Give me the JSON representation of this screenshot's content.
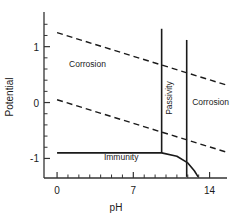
{
  "chart_data": {
    "type": "line",
    "title": "",
    "xlabel": "pH",
    "ylabel": "Potential",
    "xlim": [
      -1.2,
      15.6
    ],
    "ylim": [
      -1.35,
      1.62
    ],
    "grid": false,
    "legend": false,
    "xticks": [
      0,
      7,
      14
    ],
    "xtick_labels": [
      "0",
      "7",
      "14"
    ],
    "x_minor_ticks": [
      1,
      2,
      3,
      4,
      5,
      6,
      8,
      9,
      10,
      11,
      12,
      13
    ],
    "yticks": [
      1,
      0,
      -1
    ],
    "ytick_labels": [
      "1",
      "0",
      "-1"
    ],
    "y_minor_ticks": [
      -0.8,
      -0.6,
      -0.4,
      -0.2,
      0.2,
      0.4,
      0.6,
      0.8,
      1.2,
      1.4
    ],
    "series": [
      {
        "name": "oxygen-line",
        "style": "dashed",
        "x": [
          0,
          15.6
        ],
        "y": [
          1.25,
          0.31
        ]
      },
      {
        "name": "hydrogen-line",
        "style": "dashed",
        "x": [
          0,
          15.6
        ],
        "y": [
          0.05,
          -0.89
        ]
      },
      {
        "name": "immunity-boundary",
        "style": "solid",
        "x": [
          0,
          9.6,
          11.0,
          12.0,
          12.6,
          12.95
        ],
        "y": [
          -0.9,
          -0.9,
          -0.96,
          -1.08,
          -1.22,
          -1.33
        ]
      },
      {
        "name": "passivity-left-boundary",
        "style": "solid",
        "x": [
          9.6,
          9.6
        ],
        "y": [
          -0.9,
          1.32
        ]
      },
      {
        "name": "passivity-right-boundary",
        "style": "solid",
        "x": [
          11.9,
          11.9
        ],
        "y": [
          -1.33,
          1.12
        ]
      }
    ],
    "annotations": [
      {
        "text": "Corrosion",
        "x": 1.1,
        "y": 0.63,
        "rotation": 0,
        "name": "corrosion-left"
      },
      {
        "text": "Corrosion",
        "x": 12.4,
        "y": -0.05,
        "rotation": 0,
        "name": "corrosion-right"
      },
      {
        "text": "Passivity",
        "x": 10.55,
        "y": -0.22,
        "rotation": -90,
        "name": "passivity"
      },
      {
        "text": "Immunity",
        "x": 4.3,
        "y": -1.02,
        "rotation": 0,
        "name": "immunity"
      }
    ]
  },
  "colors": {
    "axis": "#333333",
    "line": "#1a1a1a",
    "text": "#1a1a1a",
    "background": "#ffffff"
  }
}
